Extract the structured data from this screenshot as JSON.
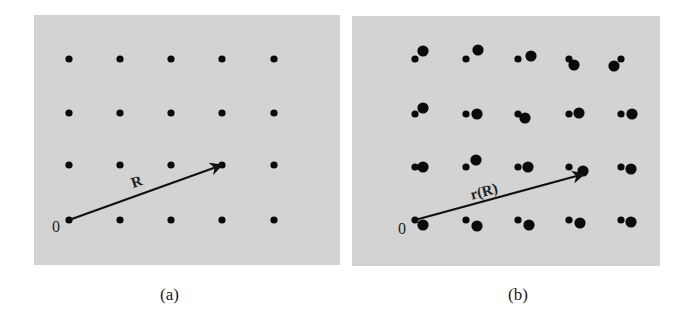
{
  "panels": [
    {
      "id": "a",
      "caption": "(a)",
      "vector_label": "R",
      "origin_label": "0",
      "background": "#d3d3d3",
      "lattice": {
        "cols_x": [
          69,
          120,
          171,
          222,
          274
        ],
        "rows_y": [
          59,
          113,
          165,
          220
        ],
        "dot_radius": 3.6
      },
      "vector": {
        "from": [
          69,
          220
        ],
        "to": [
          222,
          165
        ]
      }
    },
    {
      "id": "b",
      "caption": "(b)",
      "vector_label": "r(R)",
      "origin_label": "0",
      "background": "#d3d3d3",
      "lattice": {
        "cols_x": [
          415,
          466,
          518,
          569,
          621
        ],
        "rows_y": [
          59,
          114,
          167,
          220
        ],
        "small_radius": 3.6,
        "large_radius": 5.6,
        "large_offsets": [
          [
            [
              8,
              -8
            ],
            [
              12,
              -9
            ],
            [
              13,
              -3
            ],
            [
              5,
              6
            ],
            [
              -7,
              7
            ]
          ],
          [
            [
              8,
              -6
            ],
            [
              11,
              0
            ],
            [
              7,
              4
            ],
            [
              10,
              -1
            ],
            [
              11,
              0
            ]
          ],
          [
            [
              8,
              0
            ],
            [
              10,
              -7
            ],
            [
              10,
              0
            ],
            [
              14,
              4
            ],
            [
              10,
              2
            ]
          ],
          [
            [
              8,
              5
            ],
            [
              11,
              6
            ],
            [
              11,
              5
            ],
            [
              11,
              3
            ],
            [
              10,
              2
            ]
          ]
        ]
      },
      "vector": {
        "from": [
          415,
          220
        ],
        "to": [
          584,
          174
        ]
      }
    }
  ],
  "colors": {
    "dot": "#0a0a0a",
    "arrow": "#111111",
    "text": "#222222"
  }
}
